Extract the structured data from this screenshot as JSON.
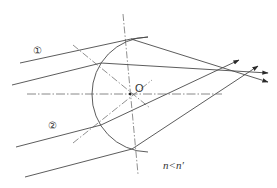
{
  "diagram": {
    "type": "optics-refraction",
    "center_label": "O",
    "ray_labels": [
      "①",
      "②"
    ],
    "relation_label": "n<n′",
    "colors": {
      "line": "#4a4a4a",
      "axis": "#6a6a6a",
      "background": "#ffffff"
    },
    "geometry": {
      "center": [
        130,
        94
      ],
      "radius": 55,
      "optical_axis": {
        "from": [
          27,
          94
        ],
        "to": [
          222,
          94
        ]
      },
      "rays": [
        {
          "bundle": 1,
          "incident_from": [
            20,
            63
          ],
          "hit": [
            131,
            39
          ],
          "refracted_to": [
            268,
            82
          ]
        },
        {
          "bundle": 1,
          "incident_from": [
            12,
            85
          ],
          "hit": [
            101,
            63
          ],
          "refracted_to": [
            268,
            73
          ]
        },
        {
          "bundle": 2,
          "incident_from": [
            16,
            147
          ],
          "hit": [
            101,
            125
          ],
          "refracted_to": [
            239,
            60
          ]
        },
        {
          "bundle": 2,
          "incident_from": [
            25,
            177
          ],
          "hit": [
            132,
            149
          ],
          "refracted_to": [
            258,
            66
          ]
        }
      ]
    }
  }
}
